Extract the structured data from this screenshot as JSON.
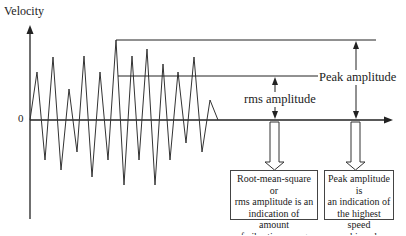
{
  "diagram": {
    "y_axis_label": "Velocity",
    "origin_label": "0",
    "annotations": {
      "peak": "Peak amplitude",
      "rms": "rms amplitude"
    },
    "boxes": {
      "rms": {
        "lines": [
          "Root-mean-square or",
          "rms amplitude is an",
          "indication of amount",
          "of vibration energy"
        ]
      },
      "peak": {
        "lines": [
          "Peak amplitude is",
          "an indication of",
          "the highest speed",
          "achieved"
        ]
      }
    },
    "colors": {
      "line": "#222222",
      "background": "#ffffff"
    }
  }
}
